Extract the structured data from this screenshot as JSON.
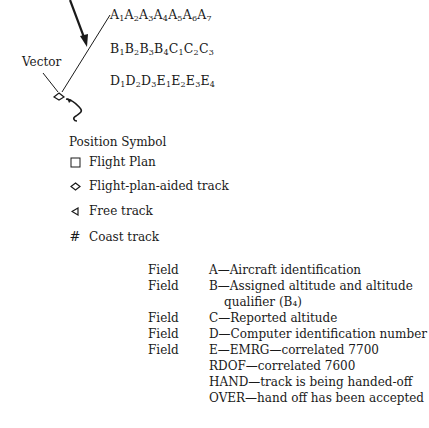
{
  "data_block": {
    "line1": [
      [
        "A",
        "1"
      ],
      [
        "A",
        "2"
      ],
      [
        "A",
        "3"
      ],
      [
        "A",
        "4"
      ],
      [
        "A",
        "5"
      ],
      [
        "A",
        "6"
      ],
      [
        "A",
        "7"
      ]
    ],
    "line2": [
      [
        "B",
        "1"
      ],
      [
        "B",
        "2"
      ],
      [
        "B",
        "3"
      ],
      [
        "B",
        "4"
      ],
      [
        "C",
        "1"
      ],
      [
        "C",
        "2"
      ],
      [
        "C",
        "3"
      ]
    ],
    "line3": [
      [
        "D",
        "1"
      ],
      [
        "D",
        "2"
      ],
      [
        "D",
        "3"
      ],
      [
        "E",
        "1"
      ],
      [
        "E",
        "2"
      ],
      [
        "E",
        "3"
      ],
      [
        "E",
        "4"
      ]
    ]
  },
  "labels": {
    "vector": "Vector"
  },
  "legend": {
    "title": "Position Symbol",
    "items": [
      {
        "symbol": "square-icon",
        "glyph": "□",
        "label": "Flight Plan"
      },
      {
        "symbol": "diamond-icon",
        "glyph": "◇",
        "label": "Flight-plan-aided track"
      },
      {
        "symbol": "triangle-left-icon",
        "glyph": "◁",
        "label": "Free track"
      },
      {
        "symbol": "hash-icon",
        "glyph": "#",
        "label": "Coast track"
      }
    ]
  },
  "fields": [
    {
      "key": "Field",
      "text": "A—Aircraft  identification"
    },
    {
      "key": "Field",
      "text": "B—Assigned altitude and altitude"
    },
    {
      "key": "",
      "text": "qualifier  (B₄)"
    },
    {
      "key": "Field",
      "text": "C—Reported altitude"
    },
    {
      "key": "Field",
      "text": "D—Computer identification number"
    },
    {
      "key": "Field",
      "text": "E—EMRG—correlated 7700"
    },
    {
      "key": "",
      "text": "RDOF—correlated 7600"
    },
    {
      "key": "",
      "text": "HAND—track is being handed-off"
    },
    {
      "key": "",
      "text": "OVER—hand off has been accepted"
    }
  ]
}
